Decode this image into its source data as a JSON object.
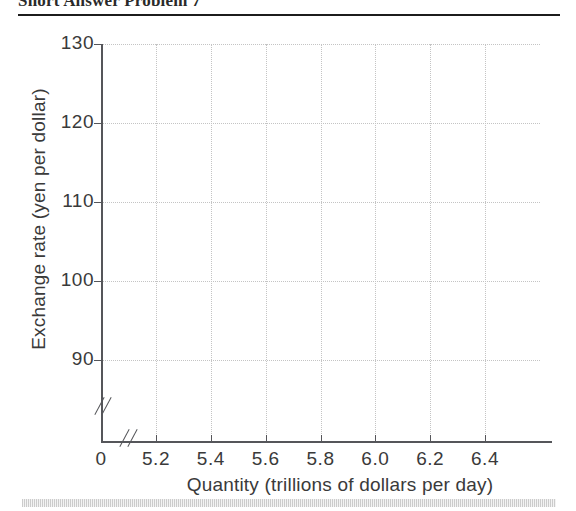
{
  "header": {
    "title": "Short Answer Problem 7"
  },
  "chart_data": {
    "type": "line",
    "title": "",
    "xlabel": "Quantity (trillions of dollars per day)",
    "ylabel": "Exchange rate (yen per dollar)",
    "xlim": [
      5.1,
      6.5
    ],
    "ylim": [
      85,
      130
    ],
    "x_ticks": [
      {
        "label": "0",
        "value": null
      },
      {
        "label": "5.2",
        "value": 5.2
      },
      {
        "label": "5.4",
        "value": 5.4
      },
      {
        "label": "5.6",
        "value": 5.6
      },
      {
        "label": "5.8",
        "value": 5.8
      },
      {
        "label": "6.0",
        "value": 6.0
      },
      {
        "label": "6.2",
        "value": 6.2
      },
      {
        "label": "6.4",
        "value": 6.4
      }
    ],
    "y_ticks": [
      {
        "label": "130",
        "value": 130
      },
      {
        "label": "120",
        "value": 120
      },
      {
        "label": "110",
        "value": 110
      },
      {
        "label": "100",
        "value": 100
      },
      {
        "label": "90",
        "value": 90
      }
    ],
    "series": [],
    "grid": true,
    "grid_style": "dotted",
    "legend": null,
    "axis_breaks": [
      "x",
      "y"
    ],
    "annotations": []
  },
  "colors": {
    "axis": "#55565a",
    "grid": "#c4c4c4",
    "text": "#3a3a3a",
    "rule": "#1c1c1c"
  }
}
